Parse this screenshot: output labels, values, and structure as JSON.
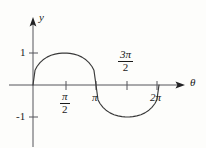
{
  "figure": {
    "background_color": "#fdfdfb",
    "ink_color": "#1a1a1a",
    "curve_color": "#3a3a3a",
    "width": 206,
    "height": 148
  },
  "axes": {
    "y_axis_label": "y",
    "x_axis_label": "θ",
    "y_ticks": [
      {
        "label": "1",
        "value": 1
      },
      {
        "label": "-1",
        "value": -1
      }
    ],
    "x_ticks": [
      {
        "label_numerator": "π",
        "label_denominator": "2",
        "is_fraction": true,
        "value": 1.5707963
      },
      {
        "label": "π",
        "is_fraction": false,
        "value": 3.1415927
      },
      {
        "label_numerator": "3π",
        "label_denominator": "2",
        "is_fraction": true,
        "value": 4.712389
      },
      {
        "label": "2π",
        "is_fraction": false,
        "value": 6.2831853
      }
    ]
  },
  "chart_data": {
    "type": "line",
    "title": "",
    "xlabel": "θ",
    "ylabel": "y",
    "grid": false,
    "legend": false,
    "xlim": [
      -0.6,
      7.4
    ],
    "ylim": [
      -1.45,
      1.45
    ],
    "xtick_labels": [
      "π/2",
      "π",
      "3π/2",
      "2π"
    ],
    "xtick_values": [
      1.5707963,
      3.1415927,
      4.712389,
      6.2831853
    ],
    "ytick_labels": [
      "1",
      "-1"
    ],
    "ytick_values": [
      1,
      -1
    ],
    "series": [
      {
        "name": "y = cbrt(sin θ) shaped cusp curve",
        "description": "Odd-symmetric cusped wave: rises steeply from 0 to a sharp cusp peak of 1 at θ=π/2, returns to 0 at θ=π, descends to a sharp cusp trough of -1 at θ=3π/2, returns to 0 at θ=2π",
        "x": [
          0.0,
          0.1,
          0.2,
          0.35,
          0.5,
          0.7,
          0.9,
          1.1,
          1.3,
          1.45,
          1.5708,
          1.69,
          1.84,
          2.04,
          2.24,
          2.44,
          2.64,
          2.79,
          2.94,
          3.04,
          3.1416,
          3.24,
          3.34,
          3.49,
          3.64,
          3.84,
          4.04,
          4.24,
          4.44,
          4.59,
          4.7124,
          4.83,
          4.98,
          5.18,
          5.38,
          5.58,
          5.78,
          5.93,
          6.08,
          6.18,
          6.2832
        ],
        "y": [
          0.0,
          0.459,
          0.578,
          0.699,
          0.786,
          0.871,
          0.928,
          0.965,
          0.99,
          0.998,
          1.0,
          0.998,
          0.99,
          0.965,
          0.928,
          0.871,
          0.786,
          0.699,
          0.578,
          0.459,
          0.0,
          -0.459,
          -0.578,
          -0.699,
          -0.786,
          -0.871,
          -0.928,
          -0.965,
          -0.99,
          -0.998,
          -1.0,
          -0.998,
          -0.99,
          -0.965,
          -0.928,
          -0.871,
          -0.786,
          -0.699,
          -0.578,
          -0.459,
          0.0
        ]
      }
    ]
  }
}
